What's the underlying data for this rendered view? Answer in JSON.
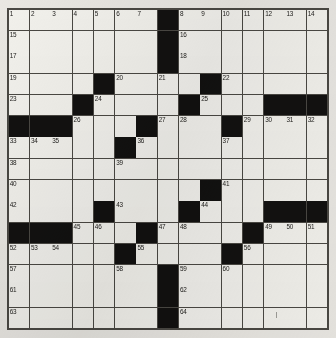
{
  "puzzle": {
    "title": "Crossword Puzzle Grid",
    "size": {
      "rows": 15,
      "cols": 15
    },
    "colors": {
      "paper": "#e9e7e2",
      "cell": "#f2f1ec",
      "block": "#121110",
      "rule": "#4a4843",
      "number": "#1d1c1a"
    },
    "blocks": [
      [
        1,
        8
      ],
      [
        2,
        8
      ],
      [
        3,
        8
      ],
      [
        4,
        5
      ],
      [
        4,
        10
      ],
      [
        5,
        4
      ],
      [
        5,
        9
      ],
      [
        5,
        13
      ],
      [
        5,
        14
      ],
      [
        5,
        15
      ],
      [
        6,
        1
      ],
      [
        6,
        2
      ],
      [
        6,
        3
      ],
      [
        6,
        7
      ],
      [
        6,
        11
      ],
      [
        7,
        6
      ],
      [
        9,
        10
      ],
      [
        10,
        5
      ],
      [
        10,
        9
      ],
      [
        10,
        13
      ],
      [
        10,
        14
      ],
      [
        10,
        15
      ],
      [
        11,
        1
      ],
      [
        11,
        2
      ],
      [
        11,
        3
      ],
      [
        11,
        7
      ],
      [
        11,
        12
      ],
      [
        12,
        6
      ],
      [
        12,
        11
      ],
      [
        13,
        8
      ],
      [
        14,
        8
      ],
      [
        15,
        8
      ]
    ],
    "numbers": [
      {
        "n": 1,
        "row": 1,
        "col": 1
      },
      {
        "n": 2,
        "row": 1,
        "col": 2
      },
      {
        "n": 3,
        "row": 1,
        "col": 3
      },
      {
        "n": 4,
        "row": 1,
        "col": 4
      },
      {
        "n": 5,
        "row": 1,
        "col": 5
      },
      {
        "n": 6,
        "row": 1,
        "col": 6
      },
      {
        "n": 7,
        "row": 1,
        "col": 7
      },
      {
        "n": 8,
        "row": 1,
        "col": 9
      },
      {
        "n": 9,
        "row": 1,
        "col": 10
      },
      {
        "n": 10,
        "row": 1,
        "col": 11
      },
      {
        "n": 11,
        "row": 1,
        "col": 12
      },
      {
        "n": 12,
        "row": 1,
        "col": 13
      },
      {
        "n": 13,
        "row": 1,
        "col": 14
      },
      {
        "n": 14,
        "row": 1,
        "col": 15
      },
      {
        "n": 15,
        "row": 2,
        "col": 1
      },
      {
        "n": 16,
        "row": 2,
        "col": 9
      },
      {
        "n": 17,
        "row": 3,
        "col": 1
      },
      {
        "n": 18,
        "row": 3,
        "col": 9
      },
      {
        "n": 19,
        "row": 4,
        "col": 1
      },
      {
        "n": 20,
        "row": 4,
        "col": 6
      },
      {
        "n": 21,
        "row": 4,
        "col": 8
      },
      {
        "n": 22,
        "row": 4,
        "col": 11
      },
      {
        "n": 23,
        "row": 5,
        "col": 1
      },
      {
        "n": 24,
        "row": 5,
        "col": 5
      },
      {
        "n": 25,
        "row": 5,
        "col": 10
      },
      {
        "n": 26,
        "row": 6,
        "col": 4
      },
      {
        "n": 27,
        "row": 6,
        "col": 8
      },
      {
        "n": 28,
        "row": 6,
        "col": 9
      },
      {
        "n": 29,
        "row": 6,
        "col": 12
      },
      {
        "n": 30,
        "row": 6,
        "col": 13
      },
      {
        "n": 31,
        "row": 6,
        "col": 14
      },
      {
        "n": 32,
        "row": 6,
        "col": 15
      },
      {
        "n": 33,
        "row": 7,
        "col": 1
      },
      {
        "n": 34,
        "row": 7,
        "col": 2
      },
      {
        "n": 35,
        "row": 7,
        "col": 3
      },
      {
        "n": 36,
        "row": 7,
        "col": 7
      },
      {
        "n": 37,
        "row": 7,
        "col": 11
      },
      {
        "n": 38,
        "row": 8,
        "col": 1
      },
      {
        "n": 39,
        "row": 8,
        "col": 6
      },
      {
        "n": 40,
        "row": 9,
        "col": 1
      },
      {
        "n": 41,
        "row": 9,
        "col": 11
      },
      {
        "n": 42,
        "row": 10,
        "col": 1
      },
      {
        "n": 43,
        "row": 10,
        "col": 6
      },
      {
        "n": 44,
        "row": 10,
        "col": 10
      },
      {
        "n": 45,
        "row": 11,
        "col": 4
      },
      {
        "n": 46,
        "row": 11,
        "col": 5
      },
      {
        "n": 47,
        "row": 11,
        "col": 8
      },
      {
        "n": 48,
        "row": 11,
        "col": 9
      },
      {
        "n": 49,
        "row": 11,
        "col": 13
      },
      {
        "n": 50,
        "row": 11,
        "col": 14
      },
      {
        "n": 51,
        "row": 11,
        "col": 15
      },
      {
        "n": 52,
        "row": 12,
        "col": 1
      },
      {
        "n": 53,
        "row": 12,
        "col": 2
      },
      {
        "n": 54,
        "row": 12,
        "col": 3
      },
      {
        "n": 55,
        "row": 12,
        "col": 7
      },
      {
        "n": 56,
        "row": 12,
        "col": 12
      },
      {
        "n": 57,
        "row": 13,
        "col": 1
      },
      {
        "n": 58,
        "row": 13,
        "col": 6
      },
      {
        "n": 59,
        "row": 13,
        "col": 9
      },
      {
        "n": 60,
        "row": 13,
        "col": 11
      },
      {
        "n": 61,
        "row": 14,
        "col": 1
      },
      {
        "n": 62,
        "row": 14,
        "col": 9
      },
      {
        "n": 63,
        "row": 15,
        "col": 1
      },
      {
        "n": 64,
        "row": 15,
        "col": 9
      }
    ],
    "entries": []
  }
}
